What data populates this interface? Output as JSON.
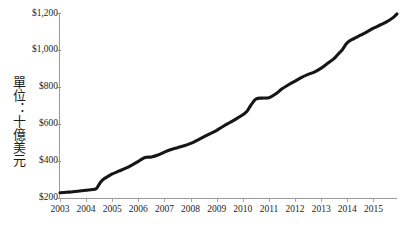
{
  "chart_data": {
    "type": "line",
    "title": "",
    "subtitle": "",
    "xlabel": "",
    "ylabel": "單位：十億美元",
    "ylabel_chars": [
      "單",
      "位",
      "：",
      "十",
      "億",
      "美",
      "元"
    ],
    "grid": false,
    "legend": null,
    "legend_position": "none",
    "xlim": [
      2003.0,
      2015.9
    ],
    "ylim": [
      200,
      1200
    ],
    "ytick_labels": [
      "$200",
      "$400",
      "$600",
      "$800",
      "$1,000",
      "$1,200"
    ],
    "ytick_values": [
      200,
      400,
      600,
      800,
      1000,
      1200
    ],
    "xtick_labels": [
      "2003",
      "2004",
      "2005",
      "2006",
      "2007",
      "2008",
      "2009",
      "2010",
      "2011",
      "2012",
      "2013",
      "2014",
      "2015"
    ],
    "xtick_values": [
      2003,
      2004,
      2005,
      2006,
      2007,
      2008,
      2009,
      2010,
      2011,
      2012,
      2013,
      2014,
      2015
    ],
    "series": [
      {
        "name": "series-1",
        "color": "#161616",
        "x": [
          2003.0,
          2003.25,
          2003.5,
          2003.75,
          2004.0,
          2004.25,
          2004.4,
          2004.55,
          2004.7,
          2004.85,
          2005.0,
          2005.25,
          2005.5,
          2005.75,
          2006.0,
          2006.15,
          2006.3,
          2006.5,
          2006.75,
          2007.0,
          2007.25,
          2007.5,
          2007.75,
          2008.0,
          2008.25,
          2008.5,
          2008.75,
          2009.0,
          2009.25,
          2009.5,
          2009.75,
          2010.0,
          2010.15,
          2010.3,
          2010.5,
          2010.75,
          2011.0,
          2011.25,
          2011.5,
          2011.75,
          2012.0,
          2012.25,
          2012.5,
          2012.75,
          2013.0,
          2013.25,
          2013.5,
          2013.65,
          2013.8,
          2014.0,
          2014.25,
          2014.5,
          2014.75,
          2015.0,
          2015.25,
          2015.5,
          2015.75,
          2015.9
        ],
        "y": [
          228,
          231,
          234,
          238,
          242,
          246,
          252,
          285,
          305,
          318,
          330,
          345,
          360,
          378,
          398,
          412,
          420,
          422,
          432,
          448,
          462,
          472,
          482,
          495,
          512,
          530,
          548,
          566,
          588,
          608,
          628,
          650,
          668,
          700,
          735,
          740,
          742,
          762,
          790,
          812,
          832,
          852,
          868,
          882,
          902,
          928,
          955,
          978,
          1000,
          1040,
          1062,
          1080,
          1098,
          1118,
          1135,
          1152,
          1175,
          1195
        ]
      }
    ]
  }
}
